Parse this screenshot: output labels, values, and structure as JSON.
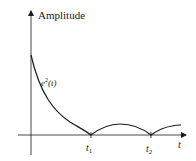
{
  "diagram": {
    "y_axis_label": "Amplitude",
    "x_axis_label": "t",
    "curve_label": {
      "base": "e",
      "sup": "2",
      "arg": "(t)"
    },
    "ticks": [
      {
        "base": "t",
        "sub": "1"
      },
      {
        "base": "t",
        "sub": "2"
      }
    ],
    "colors": {
      "line": "#1a1a1a",
      "background": "#ffffff"
    }
  }
}
